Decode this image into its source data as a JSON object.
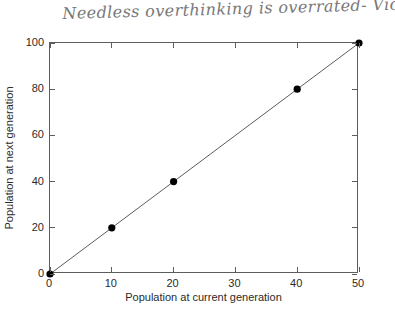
{
  "annotation": {
    "handwritten_note": "Needless overthinking is overrated- Violet"
  },
  "chart_data": {
    "type": "line",
    "title": "",
    "xlabel": "Population at current generation",
    "ylabel": "Population at next generation",
    "xlim": [
      0,
      50
    ],
    "ylim": [
      0,
      100
    ],
    "xticks": [
      0,
      10,
      20,
      30,
      40,
      50
    ],
    "yticks": [
      0,
      20,
      40,
      60,
      80,
      100
    ],
    "xtick_labels": [
      "0",
      "10",
      "20",
      "30",
      "40",
      "50"
    ],
    "ytick_labels": [
      "0",
      "20",
      "40",
      "60",
      "80",
      "100"
    ],
    "grid": false,
    "legend": null,
    "line_color": "#4a4a4a",
    "marker_color": "#000000",
    "marker": "circle",
    "series": [
      {
        "name": "y = 2x",
        "x": [
          0,
          10,
          20,
          40,
          50
        ],
        "y": [
          0,
          20,
          40,
          80,
          100
        ]
      }
    ]
  }
}
